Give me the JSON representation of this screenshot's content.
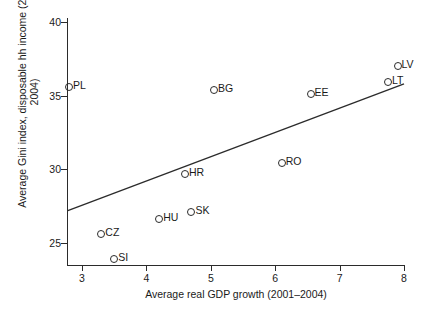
{
  "chart_data": {
    "type": "scatter",
    "title": "",
    "xlabel": "Average real GDP growth (2001–2004)",
    "ylabel": "Average Gini index, disposable hh income (2001–2004)",
    "xlim": [
      2.65,
      8.1
    ],
    "ylim": [
      23.2,
      40.3
    ],
    "xticks": [
      3,
      4,
      5,
      6,
      7,
      8
    ],
    "xtick_labels": [
      "3",
      "4",
      "5",
      "6",
      "7",
      "8"
    ],
    "yticks": [
      25,
      30,
      35,
      40
    ],
    "ytick_labels": [
      "25",
      "30",
      "35",
      "40"
    ],
    "grid": false,
    "legend": null,
    "marker": "open-circle",
    "point_color": "#2b2b2b",
    "line_color": "#2b2b2b",
    "points": [
      {
        "label": "PL",
        "x": 2.8,
        "y": 35.6
      },
      {
        "label": "CZ",
        "x": 3.3,
        "y": 25.6
      },
      {
        "label": "SI",
        "x": 3.5,
        "y": 23.9
      },
      {
        "label": "HU",
        "x": 4.2,
        "y": 26.6
      },
      {
        "label": "HR",
        "x": 4.6,
        "y": 29.7
      },
      {
        "label": "SK",
        "x": 4.7,
        "y": 27.1
      },
      {
        "label": "BG",
        "x": 5.05,
        "y": 35.4
      },
      {
        "label": "RO",
        "x": 6.1,
        "y": 30.4
      },
      {
        "label": "EE",
        "x": 6.55,
        "y": 35.1
      },
      {
        "label": "LT",
        "x": 7.75,
        "y": 35.9
      },
      {
        "label": "LV",
        "x": 7.9,
        "y": 37.0
      }
    ],
    "fit_line": {
      "name": "linear fit",
      "x0": 2.78,
      "y0": 27.2,
      "x1": 8.0,
      "y1": 35.8
    }
  }
}
